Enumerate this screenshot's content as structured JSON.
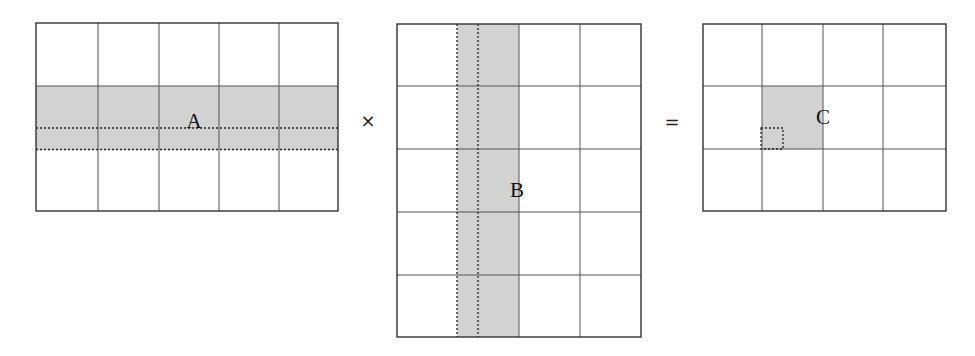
{
  "diagram": {
    "type": "matrix-multiplication",
    "operator_times": "×",
    "operator_equals": "=",
    "colors": {
      "shade": "#d2d2d2",
      "grid": "#555555",
      "border": "#333333"
    },
    "matrices": [
      {
        "id": "A",
        "label": "A",
        "rows": 3,
        "cols": 5,
        "highlight": "row 2 (shaded), dotted sub-strip at lower part"
      },
      {
        "id": "B",
        "label": "B",
        "rows": 5,
        "cols": 4,
        "highlight": "column 2 (shaded), dotted sub-strip at left part"
      },
      {
        "id": "C",
        "label": "C",
        "rows": 3,
        "cols": 4,
        "highlight": "cell (2,2) shaded, dotted sub-block at lower-left"
      }
    ]
  }
}
